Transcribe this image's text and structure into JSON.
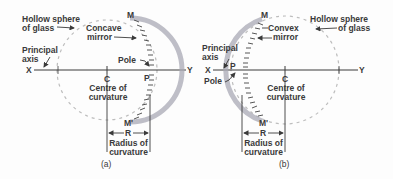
{
  "figure_a": {
    "caption": "(a)",
    "hollow_sphere_label_1": "Hollow sphere",
    "hollow_sphere_label_2": "of glass",
    "mirror_label_1": "Concave",
    "mirror_label_2": "mirror",
    "principal_axis_label_1": "Principal",
    "principal_axis_label_2": "axis",
    "pole_label": "Pole",
    "point_x": "X",
    "point_y": "Y",
    "point_c": "C",
    "point_p": "P",
    "point_m": "M",
    "point_m_prime": "M'",
    "centre_label_1": "Centre of",
    "centre_label_2": "curvature",
    "radius_symbol": "R",
    "radius_label_1": "Radius of",
    "radius_label_2": "curvature"
  },
  "figure_b": {
    "caption": "(b)",
    "hollow_sphere_label_1": "Hollow sphere",
    "hollow_sphere_label_2": "of glass",
    "mirror_label_1": "Convex",
    "mirror_label_2": "mirror",
    "principal_axis_label_1": "Principal",
    "principal_axis_label_2": "axis",
    "pole_label": "Pole",
    "point_x": "X",
    "point_y": "Y",
    "point_c": "C",
    "point_p": "P",
    "point_m": "M",
    "point_m_prime": "M'",
    "centre_label_1": "Centre of",
    "centre_label_2": "curvature",
    "radius_symbol": "R",
    "radius_label_1": "Radius of",
    "radius_label_2": "curvature"
  },
  "colors": {
    "line": "#3a3a3a",
    "dashed_circle": "#b8b8b8",
    "mirror_shade": "#9a9aa8",
    "mirror_hatch": "#444444"
  }
}
